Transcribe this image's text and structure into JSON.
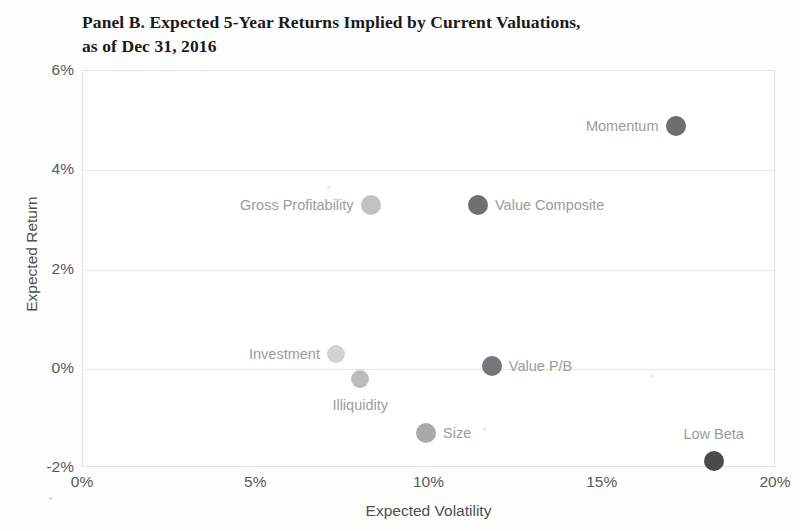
{
  "chart_data": {
    "type": "scatter",
    "title": "Panel B. Expected 5-Year Returns Implied by Current Valuations, as of Dec 31, 2016",
    "title_line1": "Panel B. Expected 5-Year Returns Implied by Current Valuations,",
    "title_line2": "as of Dec 31, 2016",
    "xlabel": "Expected Volatility",
    "ylabel": "Expected Return",
    "xlim": [
      0,
      20
    ],
    "ylim": [
      -2,
      6
    ],
    "xticks": [
      "0%",
      "5%",
      "10%",
      "15%",
      "20%"
    ],
    "xtick_values": [
      0,
      5,
      10,
      15,
      20
    ],
    "yticks": [
      "6%",
      "4%",
      "2%",
      "0%",
      "-2%"
    ],
    "ytick_values": [
      6,
      4,
      2,
      0,
      -2
    ],
    "grid": "horizontal",
    "legend": "none",
    "points": [
      {
        "name": "Momentum",
        "x": 17.1,
        "y": 4.9,
        "x_display": "17.1%",
        "y_display": "4.9%",
        "color": "#6e6e70",
        "radius": 10,
        "label_position": "left"
      },
      {
        "name": "Gross Profitability",
        "x": 8.3,
        "y": 3.3,
        "x_display": "8.3%",
        "y_display": "3.3%",
        "color": "#c2c2c4",
        "radius": 10,
        "label_position": "left"
      },
      {
        "name": "Value Composite",
        "x": 11.4,
        "y": 3.3,
        "x_display": "11.4%",
        "y_display": "3.3%",
        "color": "#6f6f71",
        "radius": 10,
        "label_position": "right"
      },
      {
        "name": "Investment",
        "x": 7.3,
        "y": 0.3,
        "x_display": "7.3%",
        "y_display": "0.3%",
        "color": "#d2d2d4",
        "radius": 9,
        "label_position": "left"
      },
      {
        "name": "Illiquidity",
        "x": 8.0,
        "y": -0.2,
        "x_display": "8.0%",
        "y_display": "-0.2%",
        "color": "#bcbcbe",
        "radius": 9,
        "label_position": "below"
      },
      {
        "name": "Value P/B",
        "x": 11.8,
        "y": 0.05,
        "x_display": "11.8%",
        "y_display": "0.1%",
        "color": "#76767a",
        "radius": 10,
        "label_position": "right"
      },
      {
        "name": "Size",
        "x": 9.9,
        "y": -1.3,
        "x_display": "9.9%",
        "y_display": "-1.3%",
        "color": "#a9a9ab",
        "radius": 10,
        "label_position": "right"
      },
      {
        "name": "Low Beta",
        "x": 18.2,
        "y": -1.85,
        "x_display": "18.2%",
        "y_display": "-1.9%",
        "color": "#4b4b4d",
        "radius": 10,
        "label_position": "above"
      }
    ]
  },
  "axes": {
    "y_title": "Expected Return",
    "x_title": "Expected Volatility"
  }
}
